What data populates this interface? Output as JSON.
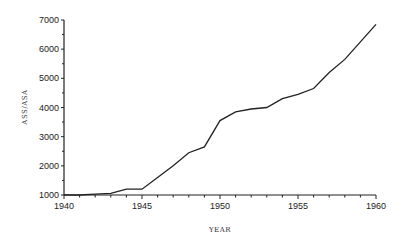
{
  "chart_data": {
    "type": "line",
    "title": "",
    "xlabel": "YEAR",
    "ylabel": "ASS/ASA",
    "xlim": [
      1940,
      1960
    ],
    "ylim": [
      1000,
      7000
    ],
    "x_ticks": [
      "1940",
      "1945",
      "1950",
      "1955",
      "1960"
    ],
    "y_ticks": [
      "1000",
      "2000",
      "3000",
      "4000",
      "5000",
      "6000",
      "7000"
    ],
    "grid": false,
    "legend": null,
    "x": [
      1940,
      1941,
      1942,
      1943,
      1944,
      1945,
      1946,
      1947,
      1948,
      1949,
      1950,
      1951,
      1952,
      1953,
      1954,
      1955,
      1956,
      1957,
      1958,
      1959,
      1960
    ],
    "series": [
      {
        "name": "ASS/ASA",
        "values": [
          1000,
          1000,
          1030,
          1060,
          1200,
          1200,
          1600,
          2000,
          2450,
          2650,
          3550,
          3850,
          3950,
          4000,
          4300,
          4450,
          4650,
          5200,
          5650,
          6250,
          6850
        ]
      }
    ]
  }
}
